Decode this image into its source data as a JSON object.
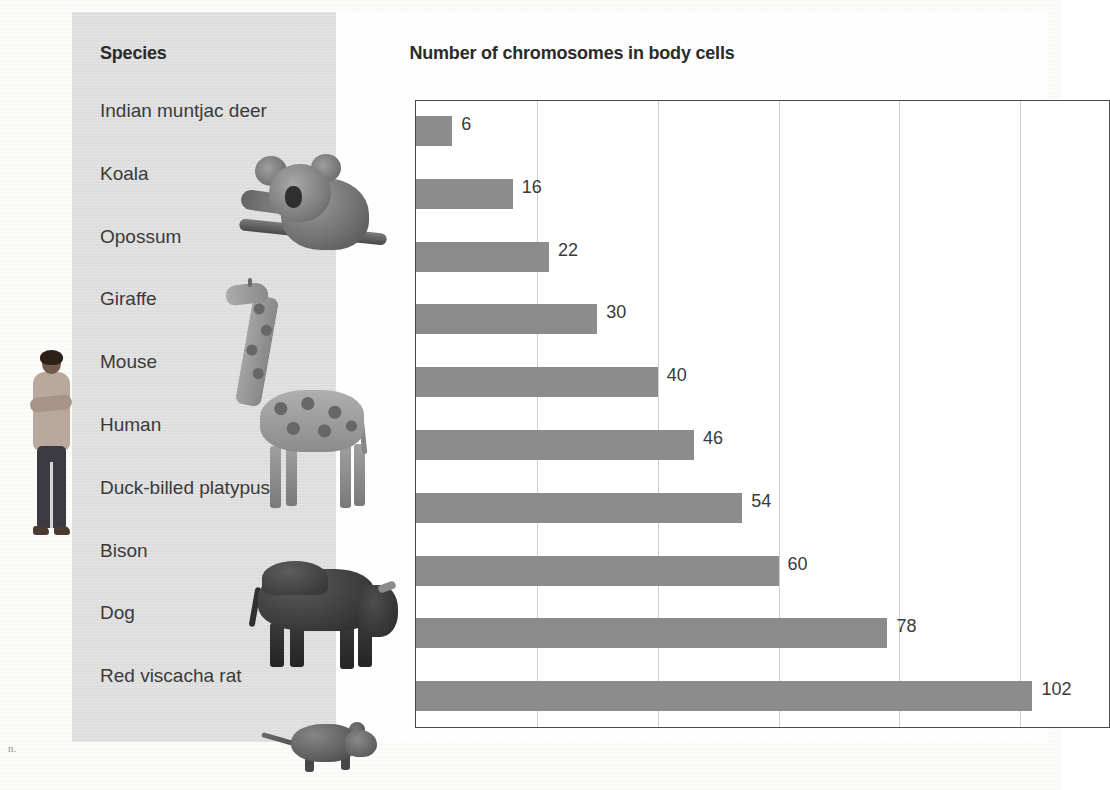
{
  "page": {
    "margin_marks": {
      "top_left": "",
      "bottom_left": "n."
    }
  },
  "figure": {
    "species_column_header": "Species",
    "chart_title": "Number of chromosomes in body cells"
  },
  "photos": [
    {
      "name": "koala-photo",
      "label": "Koala"
    },
    {
      "name": "giraffe-photo",
      "label": "Giraffe"
    },
    {
      "name": "bison-photo",
      "label": "Bison"
    },
    {
      "name": "red-viscacha-rat-photo",
      "label": "Red viscacha rat"
    },
    {
      "name": "person-photo",
      "label": "Human"
    }
  ],
  "chart_data": {
    "type": "bar",
    "orientation": "horizontal",
    "title": "Number of chromosomes in body cells",
    "xlabel": "",
    "ylabel": "Species",
    "categories": [
      "Indian muntjac deer",
      "Koala",
      "Opossum",
      "Giraffe",
      "Mouse",
      "Human",
      "Duck-billed platypus",
      "Bison",
      "Dog",
      "Red viscacha rat"
    ],
    "values": [
      6,
      16,
      22,
      30,
      40,
      46,
      54,
      60,
      78,
      102
    ],
    "value_labels": [
      "6",
      "16",
      "22",
      "30",
      "40",
      "46",
      "54",
      "60",
      "78",
      "102"
    ],
    "xlim": [
      0,
      115
    ],
    "gridlines": [
      20,
      40,
      60,
      80,
      100
    ],
    "grid": true,
    "legend": "none",
    "bar_color": "#8c8c8c",
    "plot_background": "#ffffff",
    "panel_background": "#dedede",
    "axis_color": "#4a4a4a",
    "gridline_color": "#cfcfcf",
    "text_color": "#3a3a3a"
  }
}
